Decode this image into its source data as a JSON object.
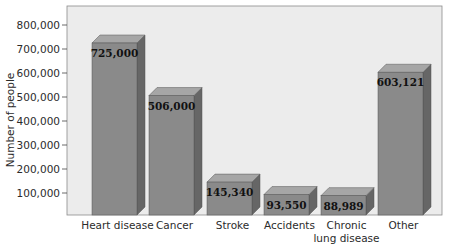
{
  "chart_data": {
    "type": "bar",
    "title": "",
    "xlabel": "",
    "ylabel": "Number of people",
    "ylim": [
      0,
      850000
    ],
    "yticks": [
      100000,
      200000,
      300000,
      400000,
      500000,
      600000,
      700000,
      800000
    ],
    "ytick_labels": [
      "100,000",
      "200,000",
      "300,000",
      "400,000",
      "500,000",
      "600,000",
      "700,000",
      "800,000"
    ],
    "categories": [
      "Heart disease",
      "Cancer",
      "Stroke",
      "Accidents",
      "Chronic lung disease",
      "Other"
    ],
    "category_lines": [
      [
        "Heart disease"
      ],
      [
        "Cancer"
      ],
      [
        "Stroke"
      ],
      [
        "Accidents"
      ],
      [
        "Chronic",
        "lung disease"
      ],
      [
        "Other"
      ]
    ],
    "values": [
      725000,
      506000,
      145340,
      93550,
      88989,
      603121
    ],
    "value_labels": [
      "725,000",
      "506,000",
      "145,340",
      "93,550",
      "88,989",
      "603,121"
    ],
    "grid": false,
    "legend": null,
    "style": "3d",
    "colors": {
      "plot_background": "#ececec",
      "bar_front": "#8a8a8a",
      "bar_top": "#a6a6a6",
      "bar_side": "#666666"
    }
  }
}
